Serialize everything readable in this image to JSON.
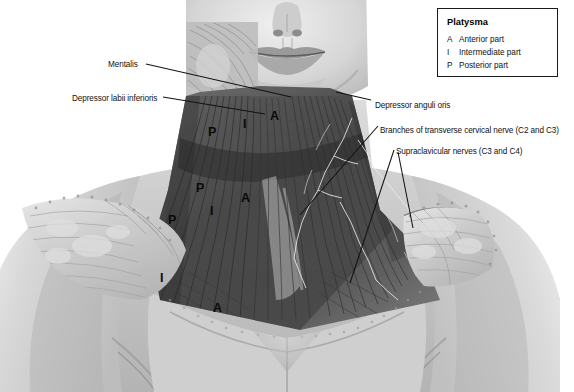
{
  "figure": {
    "background_color": "#ffffff",
    "line_color": "#111111"
  },
  "legend": {
    "title": "Platysma",
    "entries": [
      {
        "key": "A",
        "label": "Anterior part"
      },
      {
        "key": "I",
        "label": "Intermediate part"
      },
      {
        "key": "P",
        "label": "Posterior part"
      }
    ]
  },
  "labels": [
    {
      "name": "mentalis",
      "text": "Mentalis",
      "x": 108,
      "y": 61
    },
    {
      "name": "depressor-labii-inferioris",
      "text": "Depressor labii inferioris",
      "x": 72,
      "y": 95
    },
    {
      "name": "depressor-anguli-oris",
      "text": "Depressor anguli oris",
      "x": 375,
      "y": 102
    },
    {
      "name": "transverse-cervical-nerve",
      "text": "Branches of transverse cervical nerve (C2 and C3)",
      "x": 380,
      "y": 127
    },
    {
      "name": "supraclavicular-nerves",
      "text": "Supraclavicular nerves (C3 and C4)",
      "x": 396,
      "y": 148
    }
  ],
  "markers": [
    {
      "key": "P",
      "x": 208,
      "y": 126
    },
    {
      "key": "I",
      "x": 243,
      "y": 118
    },
    {
      "key": "A",
      "x": 270,
      "y": 110
    },
    {
      "key": "P",
      "x": 196,
      "y": 182
    },
    {
      "key": "I",
      "x": 210,
      "y": 205
    },
    {
      "key": "A",
      "x": 241,
      "y": 192
    },
    {
      "key": "P",
      "x": 168,
      "y": 214
    },
    {
      "key": "I",
      "x": 160,
      "y": 272
    },
    {
      "key": "A",
      "x": 213,
      "y": 302
    }
  ],
  "leaders": [
    {
      "name": "mentalis-leader",
      "points": "146,64 291,97"
    },
    {
      "name": "depressor-labii-leader",
      "points": "163,97 265,114"
    },
    {
      "name": "depressor-anguli-leader",
      "points": "371,100 336,92"
    },
    {
      "name": "transverse-cervical-leader",
      "points": "378,126 300,215"
    },
    {
      "name": "supraclavicular-leader-a",
      "points": "394,150 350,283"
    },
    {
      "name": "supraclavicular-leader-b",
      "points": "398,152 413,228"
    }
  ]
}
